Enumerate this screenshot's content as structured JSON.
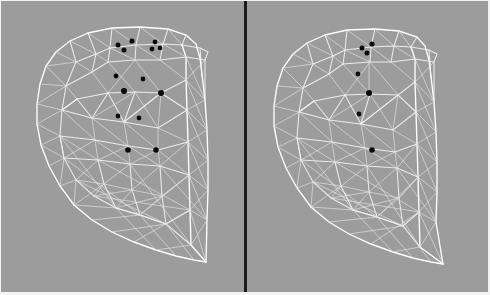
{
  "figure": {
    "type": "wireframe-mesh-pair",
    "width": 490,
    "height": 295,
    "background_color": "#9c9c9c",
    "edge_color": "#f2f2f2",
    "marker_color": "#0a0a0a",
    "divider_color": "#1b1b1f",
    "border_color": "#f4f4f4"
  },
  "layout": {
    "panel_count": 2,
    "divider": {
      "x": 244,
      "y": 0,
      "width": 3,
      "height": 295
    },
    "border": {
      "right": 2,
      "bottom": 3,
      "top": 1,
      "left": 1
    }
  },
  "panels": [
    {
      "id": "left-panel",
      "label": "Left mesh view",
      "origin": {
        "x": 0,
        "y": 0
      },
      "size": {
        "width": 244,
        "height": 295
      },
      "marker_count": 13,
      "markers": [
        {
          "x": 132,
          "y": 41,
          "r": 2.6
        },
        {
          "x": 118,
          "y": 45,
          "r": 2.5
        },
        {
          "x": 155,
          "y": 42,
          "r": 2.4
        },
        {
          "x": 124,
          "y": 50,
          "r": 2.5
        },
        {
          "x": 152,
          "y": 49,
          "r": 2.4
        },
        {
          "x": 160,
          "y": 48,
          "r": 2.3
        },
        {
          "x": 116,
          "y": 76,
          "r": 2.4
        },
        {
          "x": 143,
          "y": 79,
          "r": 2.4
        },
        {
          "x": 124,
          "y": 91,
          "r": 3.0
        },
        {
          "x": 161,
          "y": 93,
          "r": 3.0
        },
        {
          "x": 118,
          "y": 116,
          "r": 2.4
        },
        {
          "x": 139,
          "y": 118,
          "r": 2.4
        },
        {
          "x": 128,
          "y": 150,
          "r": 2.8
        },
        {
          "x": 156,
          "y": 150,
          "r": 2.8
        }
      ]
    },
    {
      "id": "right-panel",
      "label": "Right mesh view",
      "origin": {
        "x": 247,
        "y": 0
      },
      "size": {
        "width": 243,
        "height": 295
      },
      "marker_count": 7,
      "markers": [
        {
          "x": 372,
          "y": 44,
          "r": 2.6
        },
        {
          "x": 362,
          "y": 48,
          "r": 2.5
        },
        {
          "x": 367,
          "y": 53,
          "r": 2.5
        },
        {
          "x": 358,
          "y": 74,
          "r": 2.4
        },
        {
          "x": 369,
          "y": 93,
          "r": 3.0
        },
        {
          "x": 359,
          "y": 114,
          "r": 2.4
        },
        {
          "x": 372,
          "y": 150,
          "r": 2.8
        }
      ]
    }
  ],
  "annotations": {
    "description": "Two grayscale renderings of a triangulated 3D head/face surface mesh shown in near-identical viewpoints. White wireframe edges over a neutral gray background. Black dot landmarks are overlaid on the left model (dense cluster) and a reduced subset on the right model.",
    "left_caption": "",
    "right_caption": ""
  }
}
